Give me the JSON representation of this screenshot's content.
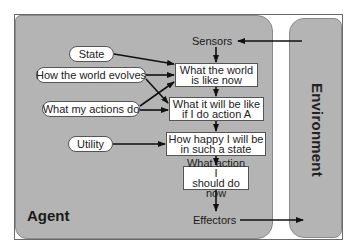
{
  "agent": {
    "label": "Agent"
  },
  "environment": {
    "label": "Environment"
  },
  "sensors": {
    "label": "Sensors"
  },
  "effectors": {
    "label": "Effectors"
  },
  "inputs": {
    "state": "State",
    "world_evolves": "How the world evolves",
    "actions_do": "What my actions do",
    "utility": "Utility"
  },
  "boxes": {
    "world_now": {
      "line1": "What the world",
      "line2": "is like now"
    },
    "if_action": {
      "line1": "What it will be like",
      "line2": "if I do action A"
    },
    "happy": {
      "line1": "How happy I will be",
      "line2": "in such a state"
    },
    "action": {
      "line1": "What action I",
      "line2": "should do now"
    }
  },
  "colors": {
    "panel": "#b4b4b4",
    "arrow": "#111111",
    "box_fill": "#ffffff"
  }
}
